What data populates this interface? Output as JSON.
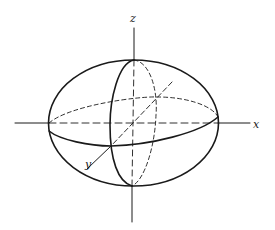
{
  "diagram": {
    "title": "",
    "type": "ellipsoid with coordinate axes",
    "labels": {
      "x_axis": "x",
      "y_axis": "y",
      "z_axis": "z"
    },
    "colors": {
      "stroke": "#1a1a1a",
      "background": "#ffffff"
    },
    "elements": [
      {
        "id": "ellipsoid-outline",
        "style": "solid"
      },
      {
        "id": "equator-front",
        "style": "solid"
      },
      {
        "id": "equator-back",
        "style": "dashed"
      },
      {
        "id": "meridian-front",
        "style": "solid"
      },
      {
        "id": "meridian-back",
        "style": "dashed"
      },
      {
        "id": "x-axis",
        "style": "solid outside, dashed inside"
      },
      {
        "id": "y-axis",
        "style": "solid outside, dashed inside"
      },
      {
        "id": "z-axis",
        "style": "solid outside, dashed inside"
      }
    ]
  }
}
